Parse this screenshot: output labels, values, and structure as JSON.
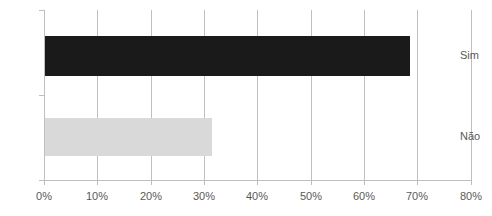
{
  "chart_data": {
    "type": "bar",
    "orientation": "horizontal",
    "title": "",
    "subtitle": "",
    "xlabel": "",
    "ylabel": "",
    "categories": [
      "Sim",
      "Não"
    ],
    "values": [
      68.5,
      31.5
    ],
    "value_labels": [
      "",
      ""
    ],
    "xlim": [
      0,
      80
    ],
    "xtick_values": [
      0,
      10,
      20,
      30,
      40,
      50,
      60,
      70,
      80
    ],
    "xtick_labels": [
      "0%",
      "10%",
      "20%",
      "30%",
      "40%",
      "50%",
      "60%",
      "70%",
      "80%"
    ],
    "grid": true,
    "grid_axis": "x",
    "legend": false,
    "legend_position": "none",
    "annotations": [],
    "series": [
      {
        "name": "",
        "values": [
          68.5,
          31.5
        ],
        "colors": [
          "#1a1a1a",
          "#d9d9d9"
        ]
      }
    ]
  },
  "colors": {
    "bar_sim": "#1a1a1a",
    "bar_nao": "#d9d9d9",
    "gridline": "#bfbfbf",
    "axis": "#bfbfbf",
    "tick_label": "#595959",
    "background": "#ffffff"
  }
}
